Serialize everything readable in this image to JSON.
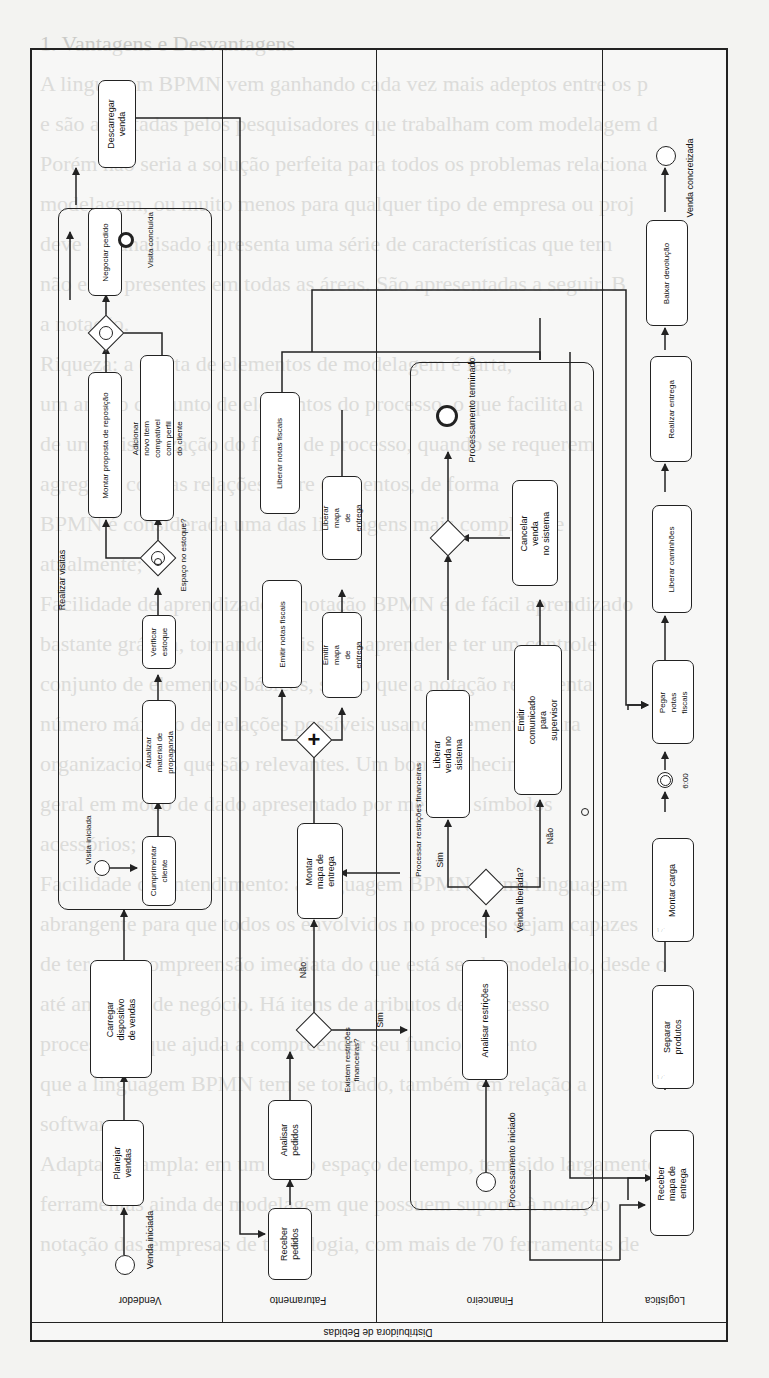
{
  "background_text": [
    "1. Vantagens e Desvantagens",
    "A linguagem BPMN vem ganhando cada vez mais adeptos entre os p",
    "e são apontadas pelos pesquisadores que trabalham com modelagem d",
    "Porém não seria a solução perfeita para todos os problemas relaciona",
    "modelagem, ou muito menos para qualquer tipo de empresa ou proj",
    "deve ser analisado apresenta uma série de características que tem",
    "não estar presentes em todas as áreas. São apresentadas a seguir. B",
    "a notação.",
    "Riqueza: a oferta de elementos de modelagem é farta,",
    "um amplo conjunto de elementos do processo, o que facilita a",
    "de uma visualização do fluxo de processo, quando se requerem",
    "agregado com as relações entre elementos, de forma",
    "BPMN é considerada uma das linguagens mais completas e",
    "atualmente;",
    "Facilidade de aprendizado: a notação BPMN é de fácil aprendizado",
    "bastante gráfica, tornando mais fácil aprender e ter um controle",
    "conjunto de elementos básicos, sendo que a notação representa",
    "número máximo de relações possíveis usando elementos para",
    "organizacionais que são relevantes. Um bom conhecimento",
    "geral em modo de dado apresentado por meio de símbolos",
    "acessórios;",
    "Facilidade de entendimento: a linguagem BPMN é uma linguagem",
    "abrangente para que todos os envolvidos no processo sejam capazes",
    "de ter uma compreensão imediata do que está sendo modelado, desde o",
    "até analistas de negócio. Há itens de atributos de processo",
    "processo, o que ajuda a compreender seu funcionamento",
    "que a linguagem BPMN tem se tornado, também em relação a",
    "software;",
    "Adaptação ampla: em um curto espaço de tempo, tem sido largamente",
    "ferramentas ainda de modelagem que possuem suporte à notação",
    "notação das empresas de tecnologia, com mais de 70 ferramentas de"
  ],
  "pool": {
    "label": "Distribuidora de Bebidas"
  },
  "lanes": [
    {
      "id": "vendedor",
      "label": "Vendedor"
    },
    {
      "id": "faturamento",
      "label": "Faturamento"
    },
    {
      "id": "financeiro",
      "label": "Financeiro"
    },
    {
      "id": "logistica",
      "label": "Logística"
    }
  ],
  "vendedor": {
    "start_event": "Venda iniciada",
    "task_planejar": "Planejar\nvendas",
    "task_carregar": "Carregar dispositivo\nde vendas",
    "subprocess_label": "Realizar visitas",
    "sub_start_event": "Visita iniciada",
    "task_cumprimentar": "Cumprimentar\ncliente",
    "task_atualizar": "Atualizar material de\npropaganda",
    "task_verificar": "Verificar\nestoque",
    "gateway_estoque": "Espaço no estoque?",
    "task_montar_proposta": "Montar proposta de reposição",
    "task_adicionar_item": "Adicionar novo item compatível\ncom perfil do cliente",
    "task_negociar": "Negociar pedido",
    "end_visita": "Visita concluída",
    "task_descarregar": "Descarregar\nvenda"
  },
  "faturamento": {
    "task_receber": "Receber\npedidos",
    "task_analisar": "Analisar\npedidos",
    "gateway_restricoes": "Existem restrições\nfinanceiras?",
    "flow_sim": "Sim",
    "flow_nao": "Não",
    "task_montar_mapa": "Montar mapa de\nentrega",
    "task_emitir_notas": "Emitir notas fiscais",
    "task_emitir_mapa": "Emitir mapa\nde entrega",
    "task_liberar_notas": "Liberar notas fiscais",
    "task_liberar_mapa": "Liberar mapa\nde entrega"
  },
  "financeiro": {
    "subprocess_label": "Processar restrições financeiras",
    "start_event": "Processamento iniciado",
    "task_analisar": "Analisar restrições",
    "gateway_liberada": "Venda liberada?",
    "flow_sim": "Sim",
    "flow_nao": "Não",
    "task_liberar_venda": "Liberar venda no\nsistema",
    "task_emitir_comunicado": "Emitir comunicado para\nsupervisor",
    "task_cancelar": "Cancelar venda\nno sistema",
    "end_event": "Processamento terminado"
  },
  "logistica": {
    "task_receber_mapa": "Receber mapa de\nentrega",
    "task_separar": "Separar\nprodutos",
    "task_montar_carga": "Montar carga",
    "timer_label": "6:00",
    "task_pegar_notas": "Pegar notas\nfiscais",
    "task_liberar_caminhoes": "Liberar caminhões",
    "task_realizar_entrega": "Realizar entrega",
    "task_baixar_devolucao": "Baixar devolução",
    "end_event": "Venda concretizada"
  },
  "colors": {
    "line": "#222222",
    "paper": "#f3f3f1",
    "ghost_text": "#c9c9c6"
  }
}
